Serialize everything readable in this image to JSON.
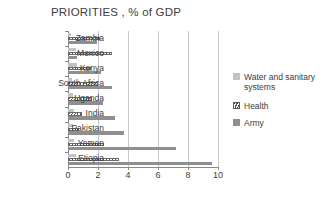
{
  "chart_data": {
    "type": "bar",
    "orientation": "horizontal",
    "title": "PRIORITIES , % of GDP",
    "xlabel": "",
    "ylabel": "",
    "xlim": [
      0,
      10
    ],
    "xticks": [
      "0",
      "2",
      "4",
      "6",
      "8",
      "10"
    ],
    "xtick_values": [
      0,
      2,
      4,
      6,
      8,
      10
    ],
    "grid": "vertical",
    "legend_position": "right",
    "categories": [
      "Zambia",
      "Mexico",
      "Kenya",
      "South Africa",
      "Uganda",
      "India",
      "Pakistan",
      "Yemen",
      "Etiopia"
    ],
    "series": [
      {
        "name": "Water and sanitary systems",
        "color": "#c3c3c3",
        "pattern": "solid-light",
        "values": [
          0.2,
          0.5,
          0.6,
          0.25,
          0.35,
          0.4,
          0.3,
          0.4,
          0.55
        ]
      },
      {
        "name": "Health",
        "color": "#555555",
        "pattern": "diagonal-hatch",
        "values": [
          2.1,
          2.9,
          1.5,
          2.0,
          1.6,
          0.9,
          0.7,
          2.4,
          3.4
        ]
      },
      {
        "name": "Army",
        "color": "#8f8f8f",
        "pattern": "solid",
        "values": [
          1.9,
          0.6,
          2.2,
          2.9,
          2.3,
          3.1,
          3.7,
          7.2,
          9.6
        ]
      }
    ]
  },
  "legend": {
    "items": [
      {
        "label": "Water and sanitary systems",
        "swatch": "sw-water"
      },
      {
        "label": "Health",
        "swatch": "sw-health"
      },
      {
        "label": "Army",
        "swatch": "sw-army"
      }
    ]
  }
}
